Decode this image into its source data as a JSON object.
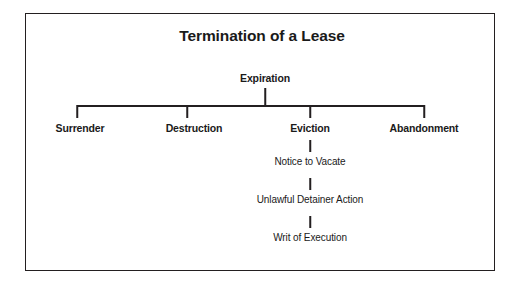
{
  "figure": {
    "title": "Termination of a Lease",
    "root": {
      "label": "Expiration"
    },
    "branches": [
      {
        "label": "Surrender"
      },
      {
        "label": "Destruction"
      },
      {
        "label": "Eviction"
      },
      {
        "label": "Abandonment"
      }
    ],
    "eviction_chain": [
      {
        "label": "Notice to Vacate"
      },
      {
        "label": "Unlawful Detainer Action"
      },
      {
        "label": "Writ of Execution"
      }
    ],
    "colors": {
      "line": "#231f20",
      "text": "#1a1a1a",
      "background": "#ffffff",
      "border": "#231f20"
    }
  }
}
